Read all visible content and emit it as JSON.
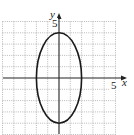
{
  "chart_data": {
    "type": "line",
    "title": "",
    "xlabel": "x",
    "ylabel": "y",
    "xlim": [
      -5,
      5
    ],
    "ylim": [
      -5,
      5
    ],
    "grid": true,
    "tick_labels": {
      "x": [
        "5"
      ],
      "y": [
        "5"
      ]
    },
    "series": [
      {
        "name": "ellipse",
        "shape": "ellipse",
        "center": [
          0,
          0
        ],
        "semi_axis_x": 2,
        "semi_axis_y": 4,
        "equation": "x^2/4 + y^2/16 = 1"
      }
    ]
  },
  "labels": {
    "x_axis": "x",
    "y_axis": "y",
    "x_tick": "5",
    "y_tick": "5"
  },
  "colors": {
    "grid": "#9a9a9a",
    "axis": "#222222",
    "curve": "#1a1a1a"
  }
}
